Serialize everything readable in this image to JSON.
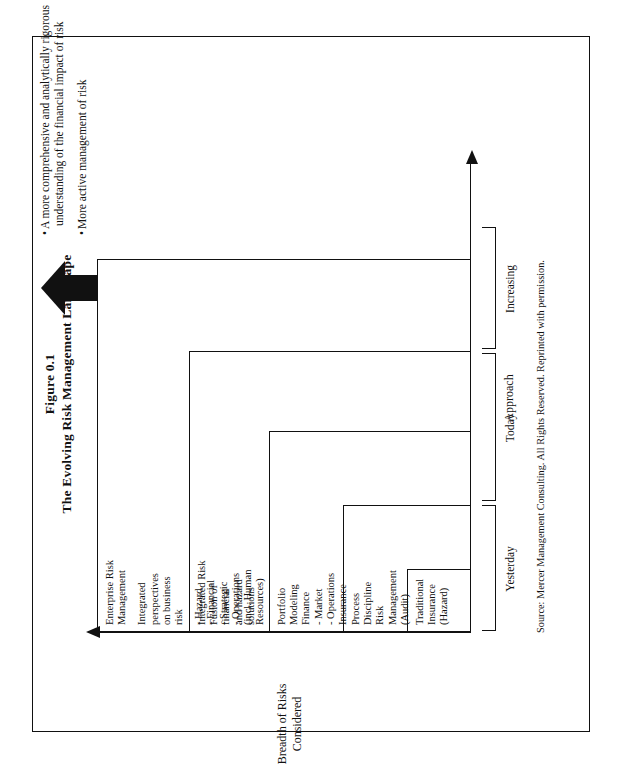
{
  "figure": {
    "number": "Figure 0.1",
    "title": "The Evolving Risk Management Landscape",
    "source": "Source: Mercer Management Consulting.  All Rights Reserved.  Reprinted with permission."
  },
  "axes": {
    "y_label_line1": "Breadth of Risks",
    "y_label_line2": "Considered",
    "x_label": "Approach",
    "x_ticks": [
      "Yesterday",
      "Today",
      "Increasing"
    ]
  },
  "stages": [
    {
      "id": "traditional-insurance",
      "heading": "Traditional",
      "lines": [
        "Insurance",
        "(Hazard)"
      ]
    },
    {
      "id": "process-discipline",
      "heading": "Process",
      "lines": [
        "Discipline",
        "Risk",
        "Management",
        "(Audit)"
      ]
    },
    {
      "id": "portfolio-modeling",
      "heading": "Portfolio",
      "lines": [
        "Modeling",
        "Finance",
        "- Market",
        "- Operations",
        "Insurance"
      ]
    },
    {
      "id": "integrated-risk",
      "heading": "Integrated Risk",
      "lines": [
        "Fusion of",
        "financial",
        "and hazard",
        "solutions"
      ]
    },
    {
      "id": "enterprise-risk-management",
      "heading": "Enterprise Risk",
      "lines": [
        "Management",
        "",
        "Integrated",
        "perspectives",
        "on business",
        "risk",
        "",
        "-  Hazard",
        "-  Financial",
        "-  Strategic",
        "-  Operations",
        "   (incl. Human",
        "   Resources)"
      ]
    }
  ],
  "conclusions": [
    "A more comprehensive and analytically rigorous understanding of the financial impact of risk",
    "More active management of risk"
  ]
}
